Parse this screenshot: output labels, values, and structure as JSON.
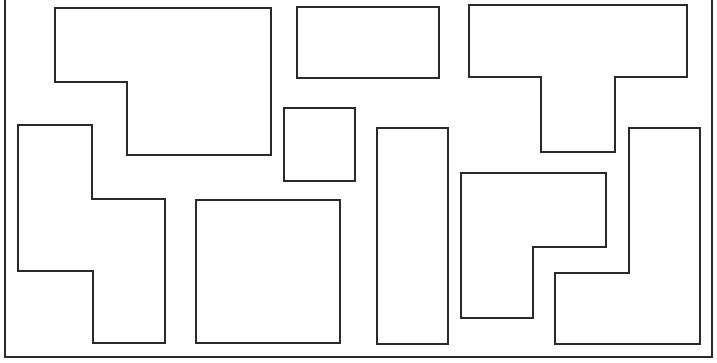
{
  "diagram": {
    "title": "",
    "width": 717,
    "height": 363,
    "stroke_color": "#2a2a2a",
    "background": "#ffffff",
    "frame": {
      "x": 5,
      "y": -2,
      "width": 707,
      "height": 359
    },
    "shapes": [
      {
        "id": "shape-top-left-step",
        "kind": "polygon",
        "points": "55,8 271,8 271,155 127,155 127,82 55,82"
      },
      {
        "id": "shape-top-middle-rect",
        "kind": "polygon",
        "points": "297,7 439,7 439,78 297,78"
      },
      {
        "id": "shape-top-right-t",
        "kind": "polygon",
        "points": "469,5 687,5 687,77 615,77 615,152 541,152 541,77 469,77"
      },
      {
        "id": "shape-left-step",
        "kind": "polygon",
        "points": "18,125 92,125 92,199 165,199 165,343 93,343 93,271 18,271"
      },
      {
        "id": "shape-small-square",
        "kind": "polygon",
        "points": "284,108 355,108 355,181 284,181"
      },
      {
        "id": "shape-large-square",
        "kind": "polygon",
        "points": "196,200 340,200 340,343 196,343"
      },
      {
        "id": "shape-tall-rect",
        "kind": "polygon",
        "points": "377,128 448,128 448,344 377,344"
      },
      {
        "id": "shape-right-step",
        "kind": "polygon",
        "points": "461,173 606,173 606,247 533,247 533,318 461,318"
      },
      {
        "id": "shape-right-l",
        "kind": "polygon",
        "points": "629,128 700,128 700,344 555,344 555,273 629,273"
      }
    ]
  }
}
